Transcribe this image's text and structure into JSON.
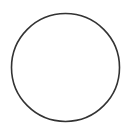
{
  "canvas": {
    "width": 129,
    "height": 127,
    "background": "#ffffff"
  },
  "shape": {
    "type": "circle",
    "cx": 65.5,
    "cy": 67.5,
    "r": 54,
    "stroke": "#333333",
    "stroke_width": 1.6,
    "fill": "none"
  }
}
